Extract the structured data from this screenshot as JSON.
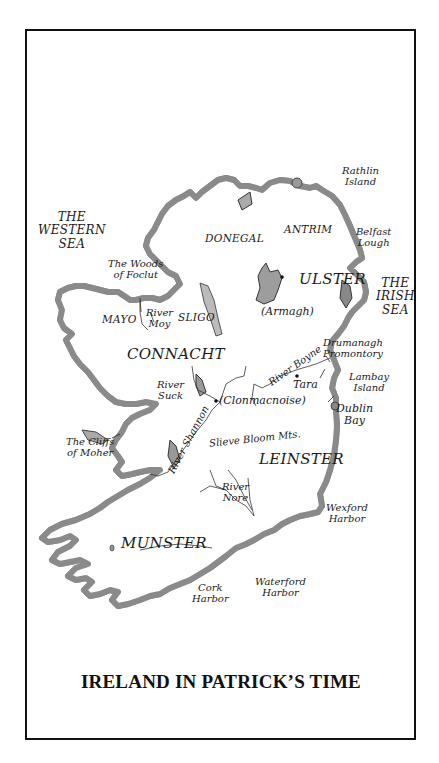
{
  "title": "IRELAND IN PATRICK’S TIME",
  "map": {
    "seas": {
      "western": [
        "THE",
        "WESTERN",
        "SEA"
      ],
      "irish": [
        "THE",
        "IRISH",
        "SEA"
      ]
    },
    "provinces": {
      "ulster": "ULSTER",
      "connacht": "CONNACHT",
      "leinster": "LEINSTER",
      "munster": "MUNSTER"
    },
    "counties": {
      "donegal": "DONEGAL",
      "antrim": "ANTRIM",
      "mayo": "MAYO",
      "sligo": "SLIGO"
    },
    "places": {
      "armagh": "(Armagh)",
      "clonmacnoise": "(Clonmacnoise)",
      "tara": "Tara"
    },
    "features": {
      "rathlin": [
        "Rathlin",
        "Island"
      ],
      "belfast": [
        "Belfast",
        "Lough"
      ],
      "woods": [
        "The Woods",
        "of Foclut"
      ],
      "moy": [
        "River",
        "Moy"
      ],
      "suck": [
        "River",
        "Suck"
      ],
      "shannon": "River Shannon",
      "boyne": "River Boyne",
      "drumanagh": [
        "Drumanagh",
        "Promontory"
      ],
      "lambay": [
        "Lambay",
        "Island"
      ],
      "dublin": [
        "Dublin",
        "Bay"
      ],
      "cliffs": [
        "The Cliffs",
        "of Moher"
      ],
      "slieve": "Slieve Bloom Mts.",
      "nore": [
        "River",
        "Nore"
      ],
      "wexford": [
        "Wexford",
        "Harbor"
      ],
      "waterford": [
        "Waterford",
        "Harbor"
      ],
      "cork": [
        "Cork",
        "Harbor"
      ]
    },
    "colors": {
      "coast": "#7a7a7a",
      "coast_inner": "#3a3a3a",
      "lake": "#9a9a9a",
      "land": "#ffffff",
      "border": "#111111"
    }
  }
}
